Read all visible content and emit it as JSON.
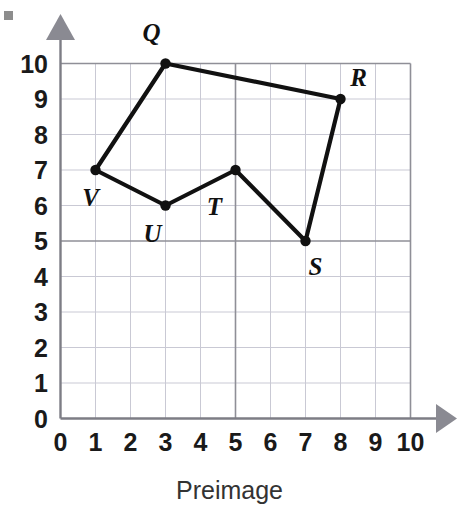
{
  "figure": {
    "caption": "Preimage",
    "corner_mark": "gray-square-artifact"
  },
  "chart_data": {
    "type": "scatter",
    "title": "",
    "subtitle": "",
    "xlabel": "Preimage",
    "ylabel": "",
    "xlim": [
      0,
      10
    ],
    "ylim": [
      0,
      10
    ],
    "xticks": [
      "0",
      "1",
      "2",
      "3",
      "4",
      "5",
      "6",
      "7",
      "8",
      "9",
      "10"
    ],
    "yticks": [
      "0",
      "1",
      "2",
      "3",
      "4",
      "5",
      "6",
      "7",
      "8",
      "9",
      "10"
    ],
    "grid": true,
    "grid_minor_spacing": 1,
    "grid_major_spacing": 5,
    "legend": "none",
    "annotations": [
      "Closed polygon QRSTUV drawn on a 10 by 10 coordinate grid",
      "Vertices are marked with filled black dots and labeled with italic capital letters"
    ],
    "polygon": {
      "name": "QRSTUV",
      "closed": true,
      "vertex_order": [
        "Q",
        "R",
        "S",
        "T",
        "U",
        "V"
      ]
    },
    "points": [
      {
        "label": "Q",
        "x": 3,
        "y": 10,
        "label_dx": -14,
        "label_dy": -32
      },
      {
        "label": "R",
        "x": 8,
        "y": 9,
        "label_dx": 18,
        "label_dy": -22
      },
      {
        "label": "S",
        "x": 7,
        "y": 5,
        "label_dx": 10,
        "label_dy": 25
      },
      {
        "label": "T",
        "x": 5,
        "y": 7,
        "label_dx": -21,
        "label_dy": 36
      },
      {
        "label": "U",
        "x": 3,
        "y": 6,
        "label_dx": -13,
        "label_dy": 27
      },
      {
        "label": "V",
        "x": 1,
        "y": 7,
        "label_dx": -5,
        "label_dy": 27
      }
    ]
  },
  "colors": {
    "polygon_stroke": "#111111",
    "vertex_fill": "#111111",
    "grid_minor": "#c9c9d4",
    "grid_major": "#8f8f97",
    "axis_line": "#7d7d85",
    "arrow": "#8a8a92",
    "label_text": "#1a1a1a",
    "caption_text": "#333333",
    "background": "#ffffff"
  }
}
